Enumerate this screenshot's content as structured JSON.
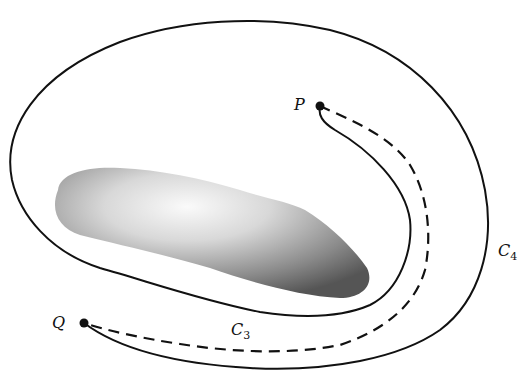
{
  "diagram": {
    "points": {
      "P": {
        "label": "P"
      },
      "Q": {
        "label": "Q"
      }
    },
    "curves": {
      "C3": {
        "label": "C",
        "subscript": "3",
        "style": "dashed"
      },
      "C4": {
        "label": "C",
        "subscript": "4",
        "style": "solid"
      }
    },
    "obstacle": {
      "shape": "elongated shaded blob"
    },
    "colors": {
      "stroke": "#111111",
      "background": "#ffffff"
    }
  }
}
